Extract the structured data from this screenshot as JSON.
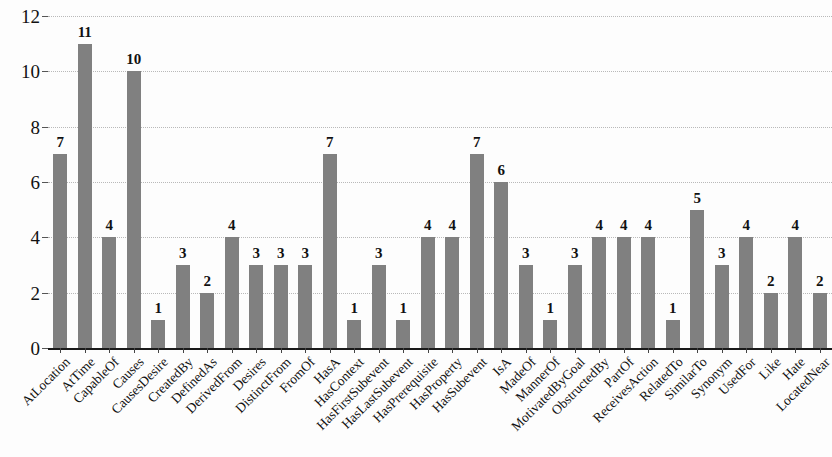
{
  "chart_data": {
    "type": "bar",
    "title": "",
    "subtitle": "",
    "xlabel": "",
    "ylabel": "",
    "ylim": [
      0,
      12
    ],
    "yticks": [
      0,
      2,
      4,
      6,
      8,
      10,
      12
    ],
    "grid": true,
    "legend": false,
    "bar_color": "#808080",
    "show_value_labels": true,
    "categories": [
      "AtLocation",
      "AtTime",
      "CapableOf",
      "Causes",
      "CausesDesire",
      "CreatedBy",
      "DefinedAs",
      "DerivedFrom",
      "Desires",
      "DistinctFrom",
      "FromOf",
      "HasA",
      "HasContext",
      "HasFirstSubevent",
      "HasLastSubevent",
      "HasPrerequisite",
      "HasProperty",
      "HasSubevent",
      "IsA",
      "MadeOf",
      "MannerOf",
      "MotivatedByGoal",
      "ObstructedBy",
      "PartOf",
      "ReceivesAction",
      "RelatedTo",
      "SimilarTo",
      "Synonym",
      "UsedFor",
      "Like",
      "Hate",
      "LocatedNear"
    ],
    "values": [
      7,
      11,
      4,
      10,
      1,
      3,
      2,
      4,
      3,
      3,
      3,
      7,
      1,
      3,
      1,
      4,
      4,
      7,
      6,
      3,
      1,
      3,
      4,
      4,
      4,
      1,
      5,
      3,
      4,
      2,
      4,
      2
    ]
  }
}
